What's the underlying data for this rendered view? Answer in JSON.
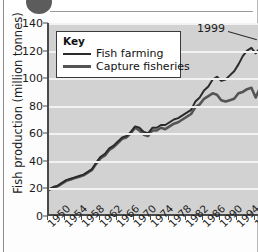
{
  "figure": {
    "badge_icon": "circle-badge-partial"
  },
  "chart_data": {
    "type": "line",
    "title": "",
    "xlabel": "",
    "ylabel": "Fish production (million tonnes)",
    "ylim": [
      0,
      140
    ],
    "yticks": [
      0,
      20,
      40,
      60,
      80,
      100,
      120,
      140
    ],
    "xlim": [
      1950,
      1999
    ],
    "xticks": [
      1950,
      1954,
      1958,
      1962,
      1966,
      1970,
      1974,
      1978,
      1982,
      1986,
      1990,
      1994,
      1998
    ],
    "xtick_labels": [
      "1950",
      "1954",
      "1958",
      "1962",
      "1966",
      "1970",
      "1974",
      "1978",
      "1982",
      "1986",
      "1990",
      "1994",
      "1998"
    ],
    "grid": true,
    "legend_title": "Key",
    "legend_position": "upper-left-inside",
    "annotations": [
      {
        "text": "1999",
        "points_to": "series-end"
      }
    ],
    "x": [
      1950,
      1951,
      1952,
      1953,
      1954,
      1955,
      1956,
      1957,
      1958,
      1959,
      1960,
      1961,
      1962,
      1963,
      1964,
      1965,
      1966,
      1967,
      1968,
      1969,
      1970,
      1971,
      1972,
      1973,
      1974,
      1975,
      1976,
      1977,
      1978,
      1979,
      1980,
      1981,
      1982,
      1983,
      1984,
      1985,
      1986,
      1987,
      1988,
      1989,
      1990,
      1991,
      1992,
      1993,
      1994,
      1995,
      1996,
      1997,
      1998,
      1999
    ],
    "series": [
      {
        "name": "Fish farming",
        "color": "#2b2b2b",
        "values": [
          19.5,
          21,
          22,
          24,
          26,
          27,
          28,
          29,
          30,
          32,
          34,
          39,
          43,
          45,
          49,
          51,
          54,
          57,
          58,
          61,
          65,
          64,
          61,
          60,
          64,
          64,
          66,
          66,
          68,
          70,
          71,
          73,
          75,
          77,
          83,
          86,
          91,
          94,
          99,
          101,
          98,
          99,
          102,
          105,
          110,
          116,
          120,
          122,
          118,
          122
        ]
      },
      {
        "name": "Capture fisheries",
        "color": "#545454",
        "values": [
          19,
          20.5,
          21.5,
          23.5,
          25.5,
          26.5,
          27.5,
          28.5,
          29.5,
          31.5,
          33.5,
          38,
          42,
          44,
          48,
          50,
          53,
          56,
          57,
          60,
          64,
          62,
          59,
          58,
          62,
          62,
          64,
          63,
          65,
          67,
          68,
          70,
          72,
          74,
          79,
          81,
          85,
          87,
          89,
          88,
          84,
          83,
          84,
          85,
          89,
          90,
          92,
          93,
          86,
          93
        ]
      }
    ]
  }
}
